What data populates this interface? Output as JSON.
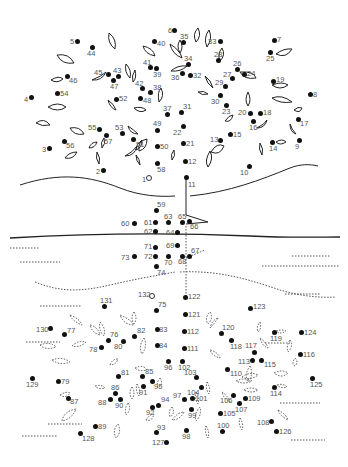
{
  "puzzle": {
    "type": "connect-the-dots",
    "subject": "tree with roots",
    "start_marker": "1",
    "second_start_marker": "132",
    "dots": [
      {
        "n": "1",
        "x": 149,
        "y": 178,
        "lx": -7,
        "ly": -2,
        "open": true
      },
      {
        "n": "2",
        "x": 103,
        "y": 170,
        "lx": -7,
        "ly": -2
      },
      {
        "n": "3",
        "x": 49,
        "y": 148,
        "lx": -7,
        "ly": -2
      },
      {
        "n": "4",
        "x": 31,
        "y": 97,
        "lx": -7,
        "ly": -1
      },
      {
        "n": "5",
        "x": 77,
        "y": 41,
        "lx": -7,
        "ly": -3
      },
      {
        "n": "6",
        "x": 174,
        "y": 30,
        "lx": -6,
        "ly": -3
      },
      {
        "n": "7",
        "x": 274,
        "y": 40,
        "lx": 3,
        "ly": -4
      },
      {
        "n": "8",
        "x": 310,
        "y": 94,
        "lx": 3,
        "ly": -3
      },
      {
        "n": "9",
        "x": 299,
        "y": 140,
        "lx": -4,
        "ly": 3
      },
      {
        "n": "10",
        "x": 249,
        "y": 166,
        "lx": -9,
        "ly": 3
      },
      {
        "n": "11",
        "x": 186,
        "y": 177,
        "lx": 2,
        "ly": 4
      },
      {
        "n": "12",
        "x": 185,
        "y": 161,
        "lx": 3,
        "ly": -3
      },
      {
        "n": "13",
        "x": 220,
        "y": 140,
        "lx": -10,
        "ly": -4
      },
      {
        "n": "14",
        "x": 272,
        "y": 142,
        "lx": -3,
        "ly": 3
      },
      {
        "n": "15",
        "x": 230,
        "y": 134,
        "lx": 3,
        "ly": -3
      },
      {
        "n": "16",
        "x": 253,
        "y": 121,
        "lx": -4,
        "ly": 3
      },
      {
        "n": "17",
        "x": 298,
        "y": 119,
        "lx": 2,
        "ly": 1
      },
      {
        "n": "18",
        "x": 260,
        "y": 113,
        "lx": 3,
        "ly": -4
      },
      {
        "n": "19",
        "x": 273,
        "y": 81,
        "lx": 3,
        "ly": -5
      },
      {
        "n": "20",
        "x": 250,
        "y": 113,
        "lx": -12,
        "ly": -4
      },
      {
        "n": "21",
        "x": 183,
        "y": 143,
        "lx": 3,
        "ly": -3
      },
      {
        "n": "22",
        "x": 183,
        "y": 126,
        "lx": -10,
        "ly": 3
      },
      {
        "n": "23",
        "x": 226,
        "y": 105,
        "lx": -4,
        "ly": 3
      },
      {
        "n": "24",
        "x": 244,
        "y": 74,
        "lx": 3,
        "ly": -4
      },
      {
        "n": "25",
        "x": 270,
        "y": 52,
        "lx": -4,
        "ly": 3
      },
      {
        "n": "26",
        "x": 237,
        "y": 69,
        "lx": -4,
        "ly": -9
      },
      {
        "n": "27",
        "x": 232,
        "y": 78,
        "lx": -9,
        "ly": -7
      },
      {
        "n": "28",
        "x": 218,
        "y": 60,
        "lx": -4,
        "ly": -9
      },
      {
        "n": "29",
        "x": 225,
        "y": 86,
        "lx": -10,
        "ly": -7
      },
      {
        "n": "30",
        "x": 220,
        "y": 95,
        "lx": -9,
        "ly": 3
      },
      {
        "n": "31",
        "x": 181,
        "y": 112,
        "lx": 2,
        "ly": -9
      },
      {
        "n": "32",
        "x": 190,
        "y": 75,
        "lx": 3,
        "ly": -3
      },
      {
        "n": "33",
        "x": 220,
        "y": 41,
        "lx": -12,
        "ly": -3
      },
      {
        "n": "34",
        "x": 188,
        "y": 64,
        "lx": -4,
        "ly": -9
      },
      {
        "n": "35",
        "x": 183,
        "y": 42,
        "lx": -3,
        "ly": -9
      },
      {
        "n": "36",
        "x": 182,
        "y": 73,
        "lx": -11,
        "ly": 1
      },
      {
        "n": "37",
        "x": 167,
        "y": 114,
        "lx": -4,
        "ly": -9
      },
      {
        "n": "38",
        "x": 150,
        "y": 92,
        "lx": 3,
        "ly": -8
      },
      {
        "n": "39",
        "x": 156,
        "y": 68,
        "lx": -3,
        "ly": 3
      },
      {
        "n": "40",
        "x": 154,
        "y": 41,
        "lx": 3,
        "ly": -1
      },
      {
        "n": "41",
        "x": 150,
        "y": 67,
        "lx": -7,
        "ly": -8
      },
      {
        "n": "42",
        "x": 142,
        "y": 88,
        "lx": -7,
        "ly": -8
      },
      {
        "n": "43",
        "x": 118,
        "y": 76,
        "lx": -5,
        "ly": -9
      },
      {
        "n": "44",
        "x": 92,
        "y": 47,
        "lx": -5,
        "ly": 3
      },
      {
        "n": "45",
        "x": 108,
        "y": 74,
        "lx": -14,
        "ly": -5
      },
      {
        "n": "46",
        "x": 67,
        "y": 76,
        "lx": 2,
        "ly": 1
      },
      {
        "n": "47",
        "x": 113,
        "y": 80,
        "lx": -3,
        "ly": 3
      },
      {
        "n": "48",
        "x": 140,
        "y": 98,
        "lx": 3,
        "ly": -1
      },
      {
        "n": "49",
        "x": 157,
        "y": 130,
        "lx": -4,
        "ly": -10
      },
      {
        "n": "50",
        "x": 157,
        "y": 146,
        "lx": 3,
        "ly": -3
      },
      {
        "n": "51",
        "x": 133,
        "y": 139,
        "lx": 3,
        "ly": 2
      },
      {
        "n": "52",
        "x": 116,
        "y": 99,
        "lx": 3,
        "ly": -4
      },
      {
        "n": "53",
        "x": 122,
        "y": 133,
        "lx": -7,
        "ly": -9
      },
      {
        "n": "54",
        "x": 57,
        "y": 93,
        "lx": 3,
        "ly": -3
      },
      {
        "n": "55",
        "x": 99,
        "y": 129,
        "lx": -11,
        "ly": -5
      },
      {
        "n": "56",
        "x": 64,
        "y": 141,
        "lx": 2,
        "ly": 1
      },
      {
        "n": "57",
        "x": 106,
        "y": 135,
        "lx": -2,
        "ly": 3
      },
      {
        "n": "58",
        "x": 157,
        "y": 163,
        "lx": 0,
        "ly": 3
      },
      {
        "n": "59",
        "x": 156,
        "y": 210,
        "lx": 1,
        "ly": -9
      },
      {
        "n": "60",
        "x": 134,
        "y": 223,
        "lx": -13,
        "ly": -3
      },
      {
        "n": "61",
        "x": 155,
        "y": 222,
        "lx": -11,
        "ly": -3
      },
      {
        "n": "62",
        "x": 155,
        "y": 231,
        "lx": -11,
        "ly": -3
      },
      {
        "n": "63",
        "x": 168,
        "y": 222,
        "lx": -4,
        "ly": -9
      },
      {
        "n": "64",
        "x": 177,
        "y": 232,
        "lx": -11,
        "ly": -3
      },
      {
        "n": "65",
        "x": 182,
        "y": 222,
        "lx": -4,
        "ly": -9
      },
      {
        "n": "66",
        "x": 189,
        "y": 221,
        "lx": 1,
        "ly": 2
      },
      {
        "n": "67",
        "x": 189,
        "y": 256,
        "lx": 2,
        "ly": -9
      },
      {
        "n": "68",
        "x": 182,
        "y": 256,
        "lx": -4,
        "ly": 2
      },
      {
        "n": "69",
        "x": 177,
        "y": 245,
        "lx": -11,
        "ly": -3
      },
      {
        "n": "70",
        "x": 168,
        "y": 256,
        "lx": -4,
        "ly": 3
      },
      {
        "n": "71",
        "x": 155,
        "y": 247,
        "lx": -11,
        "ly": -4
      },
      {
        "n": "72",
        "x": 155,
        "y": 256,
        "lx": -11,
        "ly": -3
      },
      {
        "n": "73",
        "x": 134,
        "y": 256,
        "lx": -13,
        "ly": -2
      },
      {
        "n": "74",
        "x": 156,
        "y": 266,
        "lx": 1,
        "ly": 3
      },
      {
        "n": "75",
        "x": 156,
        "y": 310,
        "lx": 2,
        "ly": -9
      },
      {
        "n": "76",
        "x": 108,
        "y": 340,
        "lx": 2,
        "ly": -9
      },
      {
        "n": "77",
        "x": 64,
        "y": 334,
        "lx": 3,
        "ly": -7
      },
      {
        "n": "78",
        "x": 101,
        "y": 347,
        "lx": -12,
        "ly": -1
      },
      {
        "n": "79",
        "x": 58,
        "y": 381,
        "lx": 3,
        "ly": -3
      },
      {
        "n": "80",
        "x": 123,
        "y": 341,
        "lx": -9,
        "ly": 2
      },
      {
        "n": "81",
        "x": 118,
        "y": 376,
        "lx": 3,
        "ly": -7
      },
      {
        "n": "82",
        "x": 134,
        "y": 336,
        "lx": 3,
        "ly": -9
      },
      {
        "n": "83",
        "x": 157,
        "y": 329,
        "lx": 2,
        "ly": -3
      },
      {
        "n": "84",
        "x": 157,
        "y": 345,
        "lx": 2,
        "ly": -3
      },
      {
        "n": "85",
        "x": 142,
        "y": 376,
        "lx": 3,
        "ly": -8
      },
      {
        "n": "86",
        "x": 115,
        "y": 393,
        "lx": -4,
        "ly": -9
      },
      {
        "n": "87",
        "x": 68,
        "y": 398,
        "lx": 2,
        "ly": 0
      },
      {
        "n": "88",
        "x": 110,
        "y": 399,
        "lx": -12,
        "ly": 0
      },
      {
        "n": "89",
        "x": 95,
        "y": 426,
        "lx": 3,
        "ly": -3
      },
      {
        "n": "90",
        "x": 120,
        "y": 399,
        "lx": -5,
        "ly": 3
      },
      {
        "n": "91",
        "x": 143,
        "y": 386,
        "lx": -4,
        "ly": 3
      },
      {
        "n": "92",
        "x": 152,
        "y": 407,
        "lx": -6,
        "ly": 2
      },
      {
        "n": "93",
        "x": 156,
        "y": 432,
        "lx": 1,
        "ly": -8
      },
      {
        "n": "94",
        "x": 158,
        "y": 405,
        "lx": 3,
        "ly": -9
      },
      {
        "n": "95",
        "x": 152,
        "y": 381,
        "lx": 2,
        "ly": 2
      },
      {
        "n": "96",
        "x": 168,
        "y": 361,
        "lx": -4,
        "ly": 3
      },
      {
        "n": "97",
        "x": 184,
        "y": 399,
        "lx": -11,
        "ly": -7
      },
      {
        "n": "98",
        "x": 186,
        "y": 430,
        "lx": -4,
        "ly": 3
      },
      {
        "n": "99",
        "x": 191,
        "y": 409,
        "lx": -3,
        "ly": 3
      },
      {
        "n": "100",
        "x": 222,
        "y": 431,
        "lx": -5,
        "ly": -9
      },
      {
        "n": "101",
        "x": 192,
        "y": 398,
        "lx": 3,
        "ly": -3
      },
      {
        "n": "102",
        "x": 182,
        "y": 361,
        "lx": -4,
        "ly": 3
      },
      {
        "n": "103",
        "x": 196,
        "y": 377,
        "lx": -12,
        "ly": -8
      },
      {
        "n": "104",
        "x": 201,
        "y": 387,
        "lx": -14,
        "ly": 2
      },
      {
        "n": "105",
        "x": 220,
        "y": 413,
        "lx": 3,
        "ly": -3
      },
      {
        "n": "106",
        "x": 233,
        "y": 395,
        "lx": -13,
        "ly": 2
      },
      {
        "n": "107",
        "x": 239,
        "y": 403,
        "lx": -4,
        "ly": 3
      },
      {
        "n": "108",
        "x": 271,
        "y": 421,
        "lx": -14,
        "ly": -2
      },
      {
        "n": "109",
        "x": 245,
        "y": 398,
        "lx": 3,
        "ly": -3
      },
      {
        "n": "110",
        "x": 227,
        "y": 369,
        "lx": 3,
        "ly": 1
      },
      {
        "n": "111",
        "x": 184,
        "y": 348,
        "lx": 3,
        "ly": -3
      },
      {
        "n": "112",
        "x": 184,
        "y": 331,
        "lx": 3,
        "ly": -3
      },
      {
        "n": "113",
        "x": 252,
        "y": 360,
        "lx": -14,
        "ly": -2
      },
      {
        "n": "114",
        "x": 274,
        "y": 387,
        "lx": -4,
        "ly": 3
      },
      {
        "n": "115",
        "x": 261,
        "y": 360,
        "lx": 3,
        "ly": 1
      },
      {
        "n": "116",
        "x": 300,
        "y": 354,
        "lx": 3,
        "ly": -3
      },
      {
        "n": "117",
        "x": 254,
        "y": 352,
        "lx": -9,
        "ly": -10
      },
      {
        "n": "118",
        "x": 231,
        "y": 340,
        "lx": -1,
        "ly": 3
      },
      {
        "n": "119",
        "x": 274,
        "y": 332,
        "lx": -4,
        "ly": 3
      },
      {
        "n": "120",
        "x": 221,
        "y": 333,
        "lx": 1,
        "ly": -9
      },
      {
        "n": "121",
        "x": 185,
        "y": 314,
        "lx": 3,
        "ly": -3
      },
      {
        "n": "122",
        "x": 185,
        "y": 297,
        "lx": 3,
        "ly": -4
      },
      {
        "n": "123",
        "x": 250,
        "y": 308,
        "lx": 3,
        "ly": -5
      },
      {
        "n": "124",
        "x": 301,
        "y": 332,
        "lx": 3,
        "ly": -3
      },
      {
        "n": "125",
        "x": 312,
        "y": 378,
        "lx": -2,
        "ly": 3
      },
      {
        "n": "126",
        "x": 276,
        "y": 431,
        "lx": 3,
        "ly": -3
      },
      {
        "n": "127",
        "x": 166,
        "y": 442,
        "lx": -14,
        "ly": -3
      },
      {
        "n": "128",
        "x": 80,
        "y": 433,
        "lx": 2,
        "ly": 2
      },
      {
        "n": "129",
        "x": 32,
        "y": 378,
        "lx": -6,
        "ly": 3
      },
      {
        "n": "130",
        "x": 50,
        "y": 328,
        "lx": -14,
        "ly": -2
      },
      {
        "n": "131",
        "x": 104,
        "y": 306,
        "lx": -4,
        "ly": -9
      },
      {
        "n": "132",
        "x": 152,
        "y": 296,
        "lx": -14,
        "ly": -5,
        "open": true
      }
    ]
  }
}
